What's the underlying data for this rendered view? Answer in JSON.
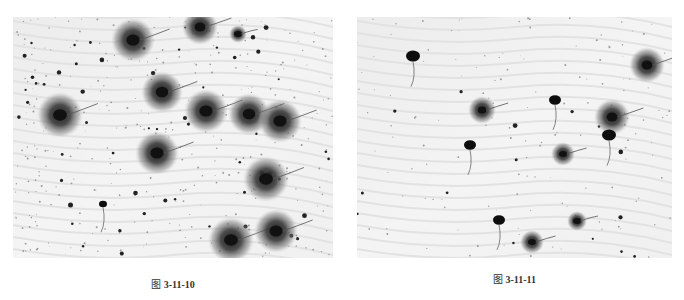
{
  "figures": [
    {
      "id": "fig-3-11-10",
      "caption_prefix": "图",
      "caption_number": "3-11-10",
      "caption": "图 3-11-10",
      "image": {
        "description": "Grayscale micrograph of sperm cells with large dark diffuse halos (sperm chromatin dispersion)",
        "cells_with_halo": [
          {
            "x": 120,
            "y": 23,
            "r": 22
          },
          {
            "x": 187,
            "y": 10,
            "r": 18
          },
          {
            "x": 225,
            "y": 17,
            "r": 9
          },
          {
            "x": 47,
            "y": 98,
            "r": 23
          },
          {
            "x": 149,
            "y": 75,
            "r": 21
          },
          {
            "x": 193,
            "y": 94,
            "r": 22
          },
          {
            "x": 236,
            "y": 97,
            "r": 21
          },
          {
            "x": 267,
            "y": 104,
            "r": 22
          },
          {
            "x": 144,
            "y": 136,
            "r": 22
          },
          {
            "x": 253,
            "y": 162,
            "r": 23
          },
          {
            "x": 218,
            "y": 223,
            "r": 23
          },
          {
            "x": 263,
            "y": 214,
            "r": 22
          }
        ],
        "cells_no_halo": [
          {
            "x": 90,
            "y": 187,
            "r": 4
          }
        ]
      }
    },
    {
      "id": "fig-3-11-11",
      "caption_prefix": "图",
      "caption_number": "3-11-11",
      "caption": "图 3-11-11",
      "image": {
        "description": "Grayscale micrograph of sperm cells, mostly with small or absent halos",
        "cells_with_halo": [
          {
            "x": 290,
            "y": 48,
            "r": 18
          },
          {
            "x": 125,
            "y": 93,
            "r": 14
          },
          {
            "x": 255,
            "y": 100,
            "r": 18
          },
          {
            "x": 206,
            "y": 137,
            "r": 12
          },
          {
            "x": 220,
            "y": 204,
            "r": 10
          },
          {
            "x": 175,
            "y": 225,
            "r": 12
          }
        ],
        "cells_no_halo": [
          {
            "x": 56,
            "y": 39,
            "r": 7
          },
          {
            "x": 198,
            "y": 83,
            "r": 6
          },
          {
            "x": 252,
            "y": 118,
            "r": 7
          },
          {
            "x": 113,
            "y": 128,
            "r": 6
          },
          {
            "x": 142,
            "y": 203,
            "r": 6
          }
        ]
      }
    }
  ]
}
